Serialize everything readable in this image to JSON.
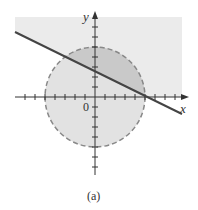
{
  "figure": {
    "caption": "(a)",
    "axes": {
      "x_label": "x",
      "y_label": "y",
      "origin_label": "0"
    },
    "colors": {
      "halfplane_fill": "#ebebeb",
      "disk_fill": "#e0e0e0",
      "intersection_fill": "#c9c9c9",
      "line": "#444444",
      "circle_stroke": "#888888",
      "axis": "#333333"
    },
    "elements": {
      "circle": {
        "center": [
          0,
          0
        ],
        "radius": 5,
        "style": "dashed"
      },
      "line": {
        "equation": "x + 2y = 5",
        "style": "solid"
      },
      "shaded_region": "half-plane above line (y > 0 portion shown) and disk, intersection darker"
    }
  }
}
